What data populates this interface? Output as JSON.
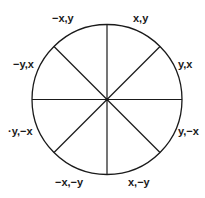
{
  "diagram": {
    "center": [
      107,
      99.5
    ],
    "radius": 75,
    "stroke_color": "#1a1a1a",
    "labels": [
      {
        "id": "nx_y",
        "text": "−x,y",
        "x": 52,
        "y": 22
      },
      {
        "id": "x_y",
        "text": "x,y",
        "x": 133,
        "y": 22
      },
      {
        "id": "ny_x",
        "text": "−y,x",
        "x": 13,
        "y": 68
      },
      {
        "id": "y_x",
        "text": "y,x",
        "x": 178,
        "y": 68
      },
      {
        "id": "ny_nx",
        "text": "·y,−x",
        "x": 8,
        "y": 135
      },
      {
        "id": "y_nx",
        "text": "y,−x",
        "x": 178,
        "y": 135
      },
      {
        "id": "nx_ny",
        "text": "−x,−y",
        "x": 55,
        "y": 186
      },
      {
        "id": "x_ny",
        "text": "x,−y",
        "x": 128,
        "y": 186
      }
    ]
  }
}
